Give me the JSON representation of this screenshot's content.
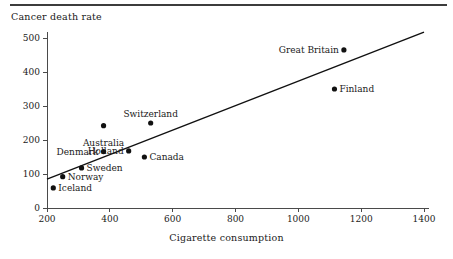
{
  "figure": {
    "y_axis_title": "Cancer death rate",
    "x_axis_title": "Cigarette consumption"
  },
  "chart_data": {
    "type": "scatter",
    "title": "",
    "xlabel": "Cigarette consumption",
    "ylabel": "Cancer death rate",
    "xlim": [
      200,
      1400
    ],
    "ylim": [
      0,
      520
    ],
    "xticks": [
      200,
      400,
      600,
      800,
      1000,
      1200,
      1400
    ],
    "yticks": [
      0,
      100,
      200,
      300,
      400,
      500
    ],
    "xtick_labels": [
      "200",
      "400",
      "600",
      "800",
      "1000",
      "1200",
      "1400"
    ],
    "ytick_labels": [
      "0",
      "100",
      "200",
      "300",
      "400",
      "500"
    ],
    "grid": false,
    "legend": "none",
    "points": [
      {
        "label": "Iceland",
        "x": 220,
        "y": 59,
        "label_pos": "right"
      },
      {
        "label": "Norway",
        "x": 250,
        "y": 92,
        "label_pos": "right"
      },
      {
        "label": "Sweden",
        "x": 310,
        "y": 118,
        "label_pos": "right"
      },
      {
        "label": "Denmark",
        "x": 380,
        "y": 166,
        "label_pos": "left"
      },
      {
        "label": "Australia",
        "x": 380,
        "y": 166,
        "label_pos": "above"
      },
      {
        "label": "Holland",
        "x": 460,
        "y": 168,
        "label_pos": "left"
      },
      {
        "label": "Canada",
        "x": 510,
        "y": 150,
        "label_pos": "right"
      },
      {
        "label": "Switzerland",
        "x": 530,
        "y": 250,
        "label_pos": "above"
      },
      {
        "label": "Great Britain",
        "x": 1145,
        "y": 465,
        "label_pos": "left"
      },
      {
        "label": "Finland",
        "x": 1115,
        "y": 350,
        "label_pos": "right"
      }
    ],
    "extra_points": [
      {
        "label": "Holland-marker",
        "x": 380,
        "y": 242
      }
    ],
    "fit_line": {
      "x_start": 200,
      "y_start": 85,
      "x_end": 1400,
      "y_end": 517
    },
    "annotations": {
      "note": "Cigarette consumption versus cancer death rate by country"
    }
  }
}
